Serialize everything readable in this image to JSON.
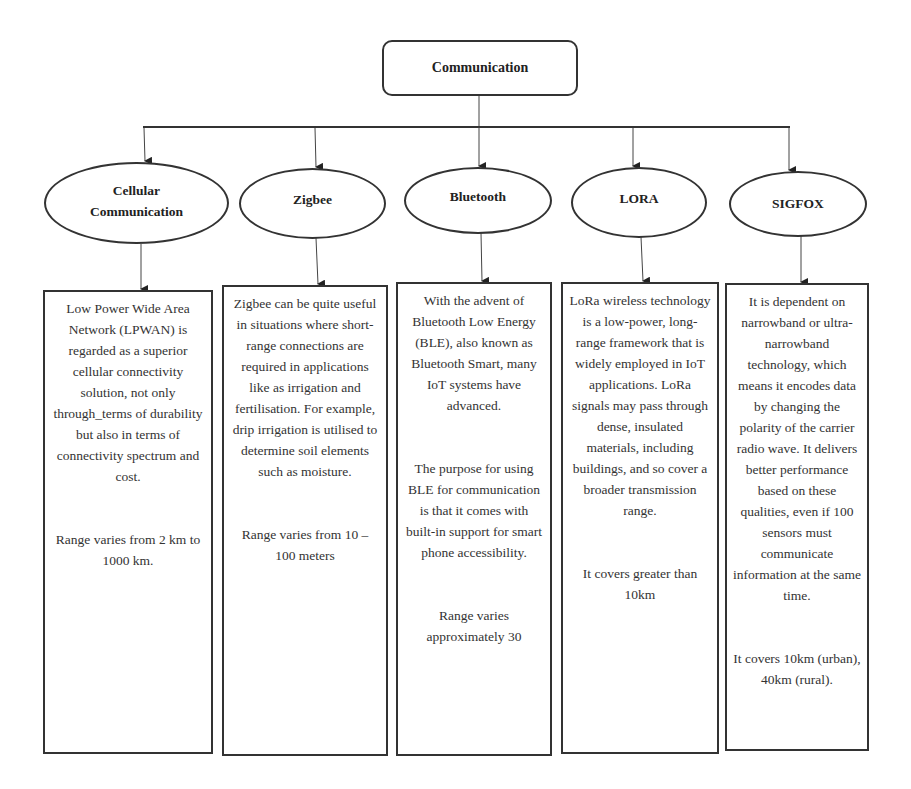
{
  "diagram": {
    "type": "hierarchy",
    "root": {
      "label": "Communication"
    },
    "nodes": [
      {
        "id": "cellular",
        "label_line1": "Cellular",
        "label_line2": "Communication",
        "description": "Low Power Wide Area Network (LPWAN) is regarded as a superior cellular connectivity solution, not only through_terms of durability but also in terms of connectivity spectrum and cost.",
        "range": "Range varies from 2 km to 1000 km."
      },
      {
        "id": "zigbee",
        "label": "Zigbee",
        "description": "Zigbee can be quite useful in situations where short-range connections are required in applications like as irrigation and fertilisation. For example, drip irrigation is utilised to determine soil elements such as moisture.",
        "range": "Range varies from 10 – 100 meters"
      },
      {
        "id": "bluetooth",
        "label": "Bluetooth",
        "description": "With the advent of Bluetooth Low Energy (BLE), also known as Bluetooth Smart, many IoT systems have advanced.",
        "description2": "The purpose for using BLE for communication is that it comes with built-in support for smart phone accessibility.",
        "range": "Range varies approximately 30"
      },
      {
        "id": "lora",
        "label": "LORA",
        "description": "LoRa wireless technology is a low-power, long-range framework that is widely employed in IoT applications. LoRa signals may pass through dense, insulated materials, including buildings, and so cover a broader transmission range.",
        "range": "It covers greater than 10km"
      },
      {
        "id": "sigfox",
        "label": "SIGFOX",
        "description": "It is dependent on narrowband or ultra-narrowband technology, which means it encodes data by changing the polarity of the carrier radio wave. It delivers better performance based on these qualities, even if 100 sensors must communicate information at the same time.",
        "range": "It covers 10km (urban), 40km (rural)."
      }
    ],
    "colors": {
      "stroke": "#333333",
      "text": "#2a2a2a",
      "background": "#ffffff"
    }
  }
}
